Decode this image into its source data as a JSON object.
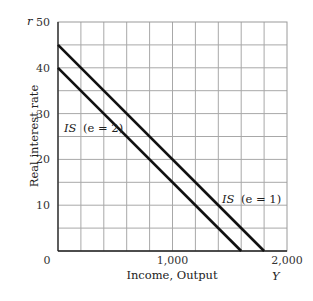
{
  "chart_data": {
    "type": "line",
    "title": "",
    "xlabel": "Income, Output",
    "xlabel_symbol": "Y",
    "ylabel": "Real interest rate",
    "ylabel_symbol": "r",
    "xlim": [
      0,
      2000
    ],
    "ylim": [
      0,
      50
    ],
    "x_ticks": [
      0,
      1000,
      2000
    ],
    "x_tick_labels": [
      "0",
      "1,000",
      "2,000"
    ],
    "y_ticks": [
      10,
      20,
      30,
      40,
      50
    ],
    "y_tick_labels": [
      "10",
      "20",
      "30",
      "40",
      "50"
    ],
    "grid": true,
    "grid_x_step": 200,
    "grid_y_step": 5,
    "series": [
      {
        "name": "IS (e = 2)",
        "x": [
          0,
          1600
        ],
        "y": [
          40,
          0
        ],
        "color": "#111111"
      },
      {
        "name": "IS (e = 1)",
        "x": [
          0,
          1800
        ],
        "y": [
          45,
          0
        ],
        "color": "#111111"
      }
    ],
    "annotations": [
      {
        "text_main": "IS",
        "text_paren": "(e = 2)",
        "x": 50,
        "y": 26
      },
      {
        "text_main": "IS",
        "text_paren": "(e = 1)",
        "x": 1170,
        "y": 14
      }
    ]
  }
}
